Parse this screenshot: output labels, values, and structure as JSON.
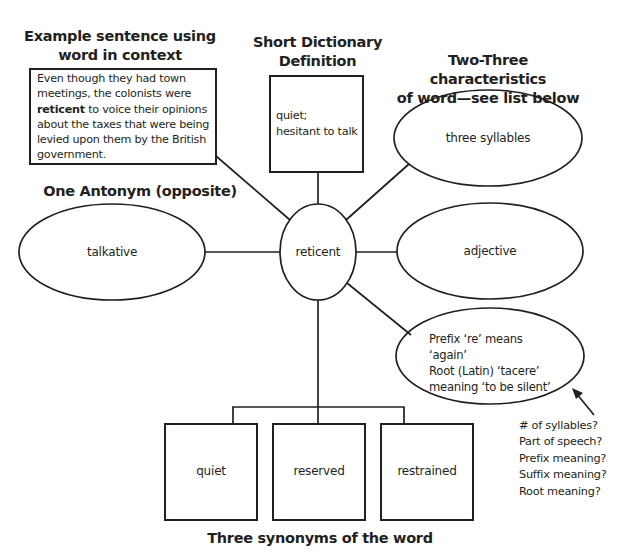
{
  "center_word": "reticent",
  "sections": {
    "sentence": {
      "heading_line1": "Example sentence using",
      "heading_line2": "word in context",
      "text_before": "Even though they had town meetings, the colonists were ",
      "bold_word": "reticent",
      "text_after": " to voice their opinions about the taxes that were being levied upon them by the British government."
    },
    "definition": {
      "heading_line1": "Short Dictionary",
      "heading_line2": "Definition",
      "line1": "quiet;",
      "line2": "hesitant to talk"
    },
    "characteristics": {
      "heading_line1": "Two-Three characteristics",
      "heading_line2": "of word—see list below",
      "items": [
        "three syllables",
        "adjective"
      ],
      "etymology": {
        "line1": "Prefix ‘re’ means ‘again’",
        "line2": "Root (Latin) ‘tacere’",
        "line3": "meaning ‘to be silent’"
      }
    },
    "antonym": {
      "heading": "One Antonym (opposite)",
      "value": "talkative"
    },
    "synonyms": {
      "heading": "Three synonyms of the word",
      "items": [
        "quiet",
        "reserved",
        "restrained"
      ]
    },
    "hint_list": {
      "items": [
        "# of syllables?",
        "Part of speech?",
        "Prefix meaning?",
        "Suffix meaning?",
        "Root meaning?"
      ]
    }
  },
  "colors": {
    "stroke": "#231f20",
    "background": "#ffffff"
  }
}
